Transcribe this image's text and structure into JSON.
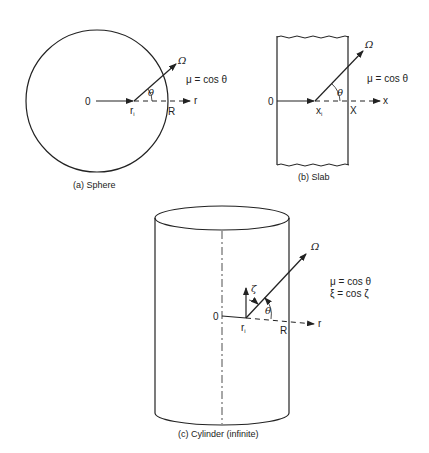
{
  "panels": {
    "sphere": {
      "caption": "(a) Sphere",
      "origin": "0",
      "position": "r",
      "position_sub": "i",
      "boundary": "R",
      "axis": "r",
      "direction": "Ω",
      "angle": "θ",
      "equation": "μ = cos θ"
    },
    "slab": {
      "caption": "(b) Slab",
      "origin": "0",
      "position": "x",
      "position_sub": "i",
      "boundary": "X",
      "axis": "x",
      "direction": "Ω",
      "angle": "θ",
      "equation": "μ = cos θ"
    },
    "cylinder": {
      "caption": "(c) Cylinder (infinite)",
      "origin": "0",
      "position": "r",
      "position_sub": "i",
      "boundary": "R",
      "axis": "r",
      "direction": "Ω",
      "angle": "θ",
      "vertical_angle": "ζ",
      "equation1": "μ = cos θ",
      "equation2": "ξ = cos ζ"
    }
  }
}
